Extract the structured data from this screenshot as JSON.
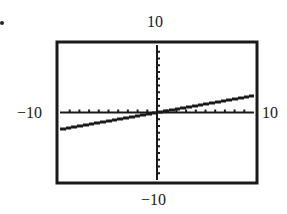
{
  "chart_data": {
    "type": "line",
    "title": "",
    "xlabel": "",
    "ylabel": "",
    "xlim": [
      -10,
      10
    ],
    "ylim": [
      -10,
      10
    ],
    "window_labels": {
      "ymax": "10",
      "ymin": "−10",
      "xmin": "−10",
      "xmax": "10"
    },
    "grid": false,
    "ticks": {
      "x_step": 1,
      "y_step": 1
    },
    "series": [
      {
        "name": "graph",
        "style": "stepped-pixel",
        "x": [
          -10,
          -5,
          0,
          5,
          10
        ],
        "y": [
          -2.5,
          -1.25,
          0,
          1.25,
          2.5
        ]
      }
    ],
    "legend": null
  },
  "frame": {
    "left": 57,
    "top": 42,
    "right": 257,
    "bottom": 183
  },
  "colors": {
    "ink": "#1a1a1a",
    "background": "#ffffff"
  },
  "bullet_marker": "•"
}
